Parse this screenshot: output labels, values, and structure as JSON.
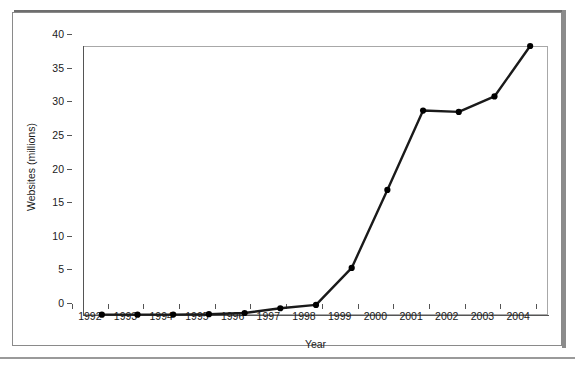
{
  "chart_data": {
    "type": "line",
    "title": "",
    "xlabel": "Year",
    "ylabel": "Websites (millions)",
    "categories": [
      "1992",
      "1993",
      "1994",
      "1995",
      "1996",
      "1997",
      "1998",
      "1999",
      "2000",
      "2001",
      "2002",
      "2003",
      "2004"
    ],
    "values": [
      0.05,
      0.05,
      0.06,
      0.12,
      0.3,
      1.0,
      1.5,
      7.0,
      18.6,
      30.4,
      30.2,
      32.5,
      40.0
    ],
    "series": [
      {
        "name": "Websites",
        "values": [
          0.05,
          0.05,
          0.06,
          0.12,
          0.3,
          1.0,
          1.5,
          7.0,
          18.6,
          30.4,
          30.2,
          32.5,
          40.0
        ]
      }
    ],
    "ylim": [
      0,
      40
    ],
    "yticks": [
      0,
      5,
      10,
      15,
      20,
      25,
      30,
      35,
      40
    ],
    "ytick_labels": [
      "0",
      "5",
      "10",
      "15",
      "20",
      "25",
      "30",
      "35",
      "40"
    ],
    "grid": false,
    "legend": "none",
    "marker": "filled-circle",
    "line_color": "#1a1a1a",
    "marker_color": "#000000"
  },
  "axes": {
    "x_title": "Year",
    "y_title": "Websites (millions)"
  },
  "colors": {
    "line": "#1a1a1a",
    "marker": "#000000",
    "frame": "#8a8a8a",
    "plot_border": "#a8a8a8",
    "axis": "#555555",
    "background": "#ffffff"
  }
}
